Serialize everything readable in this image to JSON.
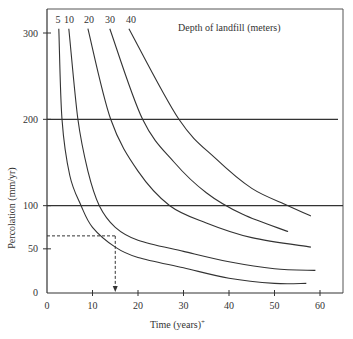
{
  "chart_data": {
    "type": "line",
    "title": "",
    "annotation": "Depth of landfill (meters)",
    "xlabel": "Time (years)*",
    "ylabel": "Percolation (mm/yr)",
    "xlim": [
      0,
      60
    ],
    "ylim": [
      0,
      300
    ],
    "x_ticks": [
      0,
      10,
      20,
      30,
      40,
      50,
      60
    ],
    "y_ticks": [
      0,
      50,
      100,
      200,
      300
    ],
    "grid": false,
    "reference_lines": [
      {
        "orientation": "horizontal",
        "value": 200
      },
      {
        "orientation": "horizontal",
        "value": 100
      }
    ],
    "example_lookup": {
      "percolation": 65,
      "time": 15,
      "style": "dashed",
      "arrow": "down"
    },
    "series": [
      {
        "name": "5",
        "points": [
          [
            2.6,
            305
          ],
          [
            3.3,
            200
          ],
          [
            5,
            135
          ],
          [
            7.5,
            100
          ],
          [
            10,
            75
          ],
          [
            15,
            52
          ],
          [
            20,
            40
          ],
          [
            30,
            28
          ],
          [
            40,
            16
          ],
          [
            50,
            10
          ],
          [
            57,
            10
          ]
        ]
      },
      {
        "name": "10",
        "points": [
          [
            4.8,
            305
          ],
          [
            6.8,
            200
          ],
          [
            9,
            140
          ],
          [
            11.5,
            100
          ],
          [
            15,
            75
          ],
          [
            20,
            60
          ],
          [
            30,
            47
          ],
          [
            40,
            35
          ],
          [
            50,
            27
          ],
          [
            59,
            25
          ]
        ]
      },
      {
        "name": "20",
        "points": [
          [
            9,
            305
          ],
          [
            14,
            200
          ],
          [
            20,
            140
          ],
          [
            27,
            100
          ],
          [
            35,
            80
          ],
          [
            45,
            63
          ],
          [
            58,
            52
          ]
        ]
      },
      {
        "name": "30",
        "points": [
          [
            13.8,
            305
          ],
          [
            21,
            200
          ],
          [
            28,
            150
          ],
          [
            35,
            115
          ],
          [
            43,
            90
          ],
          [
            53,
            70
          ]
        ]
      },
      {
        "name": "40",
        "points": [
          [
            18,
            305
          ],
          [
            29,
            200
          ],
          [
            37,
            155
          ],
          [
            45,
            120
          ],
          [
            53,
            100
          ],
          [
            58,
            88
          ]
        ]
      }
    ]
  },
  "labels": {
    "depth_title": "Depth of landfill (meters)",
    "xlabel": "Time (years)",
    "xlabel_mark": "+",
    "ylabel": "Percolation (mm/yr)",
    "series_labels": [
      "5",
      "10",
      "20",
      "30",
      "40"
    ],
    "x_tick_labels": [
      "0",
      "10",
      "20",
      "30",
      "40",
      "50",
      "60"
    ],
    "y_tick_labels": [
      "0",
      "50",
      "100",
      "200",
      "300"
    ]
  },
  "colors": {
    "line": "#333333",
    "frame": "#555555",
    "background": "#ffffff"
  }
}
